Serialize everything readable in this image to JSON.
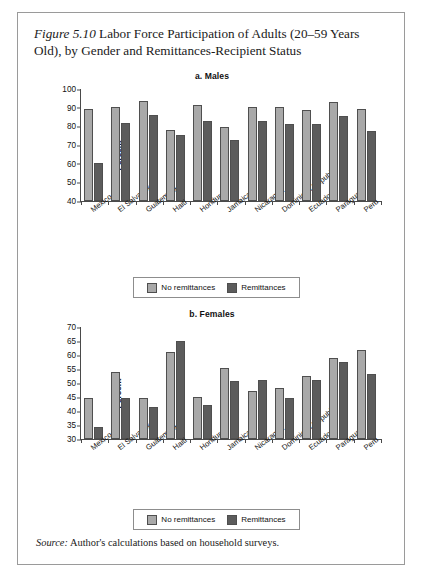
{
  "figure": {
    "label": "Figure 5.10",
    "title": "Labor Force Participation of Adults (20–59 Years Old), by Gender and Remittances-Recipient Status",
    "source_label": "Source:",
    "source_text": "Author's calculations based on household surveys."
  },
  "legend": {
    "no_remittances": "No remittances",
    "remittances": "Remittances"
  },
  "colors": {
    "no_remittances": "#a9a9a9",
    "remittances": "#5c5c5c",
    "axis": "#4a4a4a",
    "border": "#9a9a9a"
  },
  "chart_data": [
    {
      "type": "bar",
      "title": "a. Males",
      "xlabel": "",
      "ylabel": "Percent",
      "ylim": [
        40,
        100
      ],
      "yticks": [
        40,
        50,
        60,
        70,
        80,
        90,
        100
      ],
      "grid": false,
      "legend_position": "bottom",
      "categories": [
        "Mexico",
        "El Salvador",
        "Guatemala",
        "Haiti",
        "Honduras",
        "Jamaica",
        "Nicaragua",
        "Dominican Republic",
        "Ecuador",
        "Paraguay",
        "Peru"
      ],
      "series": [
        {
          "name": "No remittances",
          "values": [
            89.4,
            90.1,
            93.5,
            78.2,
            91.2,
            79.6,
            90.5,
            90.4,
            88.9,
            93.1,
            89.2
          ]
        },
        {
          "name": "Remittances",
          "values": [
            60.3,
            81.9,
            86.2,
            75.1,
            83.0,
            72.7,
            82.6,
            81.4,
            81.1,
            85.7,
            77.3
          ]
        }
      ]
    },
    {
      "type": "bar",
      "title": "b. Females",
      "xlabel": "",
      "ylabel": "Percent",
      "ylim": [
        30,
        70
      ],
      "yticks": [
        30,
        35,
        40,
        45,
        50,
        55,
        60,
        65,
        70
      ],
      "grid": false,
      "legend_position": "bottom",
      "categories": [
        "Mexico",
        "El Salvador",
        "Guatemala",
        "Haiti",
        "Honduras",
        "Jamaica",
        "Nicaragua",
        "Dominican Republic",
        "Ecuador",
        "Paraguay",
        "Peru"
      ],
      "series": [
        {
          "name": "No remittances",
          "values": [
            44.5,
            53.8,
            44.6,
            61.0,
            44.9,
            55.3,
            47.0,
            48.3,
            52.5,
            58.9,
            61.8
          ]
        },
        {
          "name": "Remittances",
          "values": [
            34.2,
            44.5,
            41.4,
            65.0,
            42.1,
            50.6,
            50.9,
            44.7,
            51.2,
            57.5,
            53.2
          ]
        }
      ]
    }
  ]
}
